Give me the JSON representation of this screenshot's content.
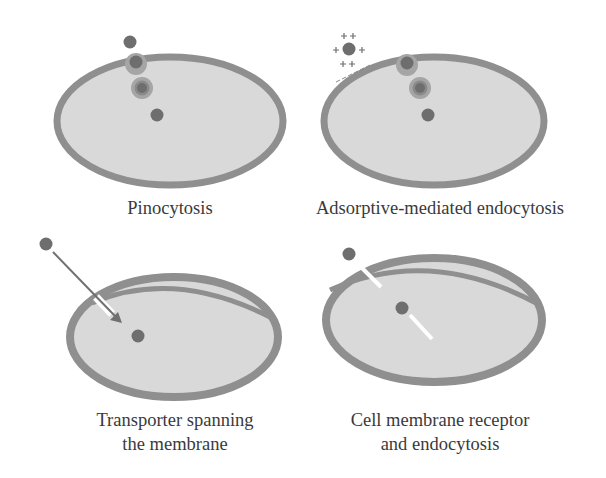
{
  "colors": {
    "background": "#ffffff",
    "membrane": "#8f8f8f",
    "cytoplasm": "#d9d9d9",
    "molecule": "#6e6e6e",
    "vesicle_ring": "#a5a5a5",
    "channel": "#ffffff",
    "text": "#3a3a3a"
  },
  "panels": [
    {
      "id": "pinocytosis",
      "label_lines": [
        "Pinocytosis"
      ],
      "elements": [
        "free molecule outside cell",
        "invaginating vesicle at membrane",
        "internalized vesicle",
        "released molecule inside cell"
      ]
    },
    {
      "id": "adsorptive-mediated-endocytosis",
      "label_lines": [
        "Adsorptive-mediated endocytosis"
      ],
      "charges": {
        "molecule": "+ + + + + +",
        "membrane": "- - - - -"
      },
      "elements": [
        "positively charged molecule",
        "negatively charged membrane surface",
        "invaginating vesicle",
        "internalized vesicle",
        "released molecule"
      ]
    },
    {
      "id": "transporter",
      "label_lines": [
        "Transporter spanning",
        "the membrane"
      ],
      "elements": [
        "molecule outside",
        "transport arrow through channel",
        "molecule inside cell"
      ]
    },
    {
      "id": "receptor-endocytosis",
      "label_lines": [
        "Cell membrane receptor",
        "and endocytosis"
      ],
      "elements": [
        "molecule bound to receptor outside",
        "receptor in membrane",
        "internalized molecule with receptor"
      ]
    }
  ]
}
